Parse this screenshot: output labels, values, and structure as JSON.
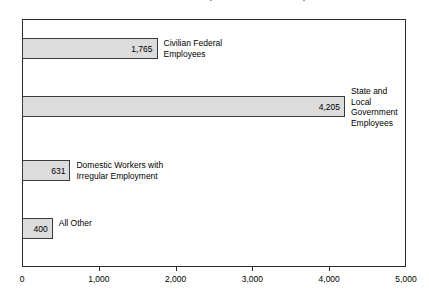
{
  "chart_data": {
    "type": "bar",
    "orientation": "horizontal",
    "title": "as of December 1997 (estimates in thousands)",
    "title_visible": false,
    "title_note": "title row is cropped off the top edge of the screenshot",
    "categories": [
      "Civilian Federal\nEmployees",
      "State and\nLocal\nGovernment\nEmployees",
      "Domestic Workers with\nIrregular Employment",
      "All Other"
    ],
    "values": [
      1765,
      4205,
      631,
      400
    ],
    "value_labels": [
      "1,765",
      "4,205",
      "631",
      "400"
    ],
    "xlabel": "",
    "ylabel": "",
    "xlim": [
      0,
      5000
    ],
    "xticks": [
      0,
      1000,
      2000,
      3000,
      4000,
      5000
    ],
    "xtick_labels": [
      "0",
      "1,000",
      "2,000",
      "3,000",
      "4,000",
      "5,000"
    ],
    "grid": false,
    "legend": false,
    "bar_fill_color": "#dcdcdc",
    "bar_border_color": "#3a3a3a",
    "axis_color": "#2a2a2a",
    "background_color": "#ffffff"
  }
}
